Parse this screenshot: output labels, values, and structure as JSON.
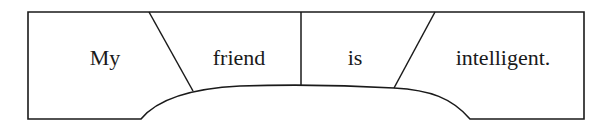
{
  "diagram": {
    "type": "sentence-constituent-diagram",
    "stroke_color": "#1a1a1a",
    "background": "#ffffff",
    "words": [
      {
        "id": "w1",
        "text": "My"
      },
      {
        "id": "w2",
        "text": "friend"
      },
      {
        "id": "w3",
        "text": "is"
      },
      {
        "id": "w4",
        "text": "intelligent."
      }
    ]
  }
}
